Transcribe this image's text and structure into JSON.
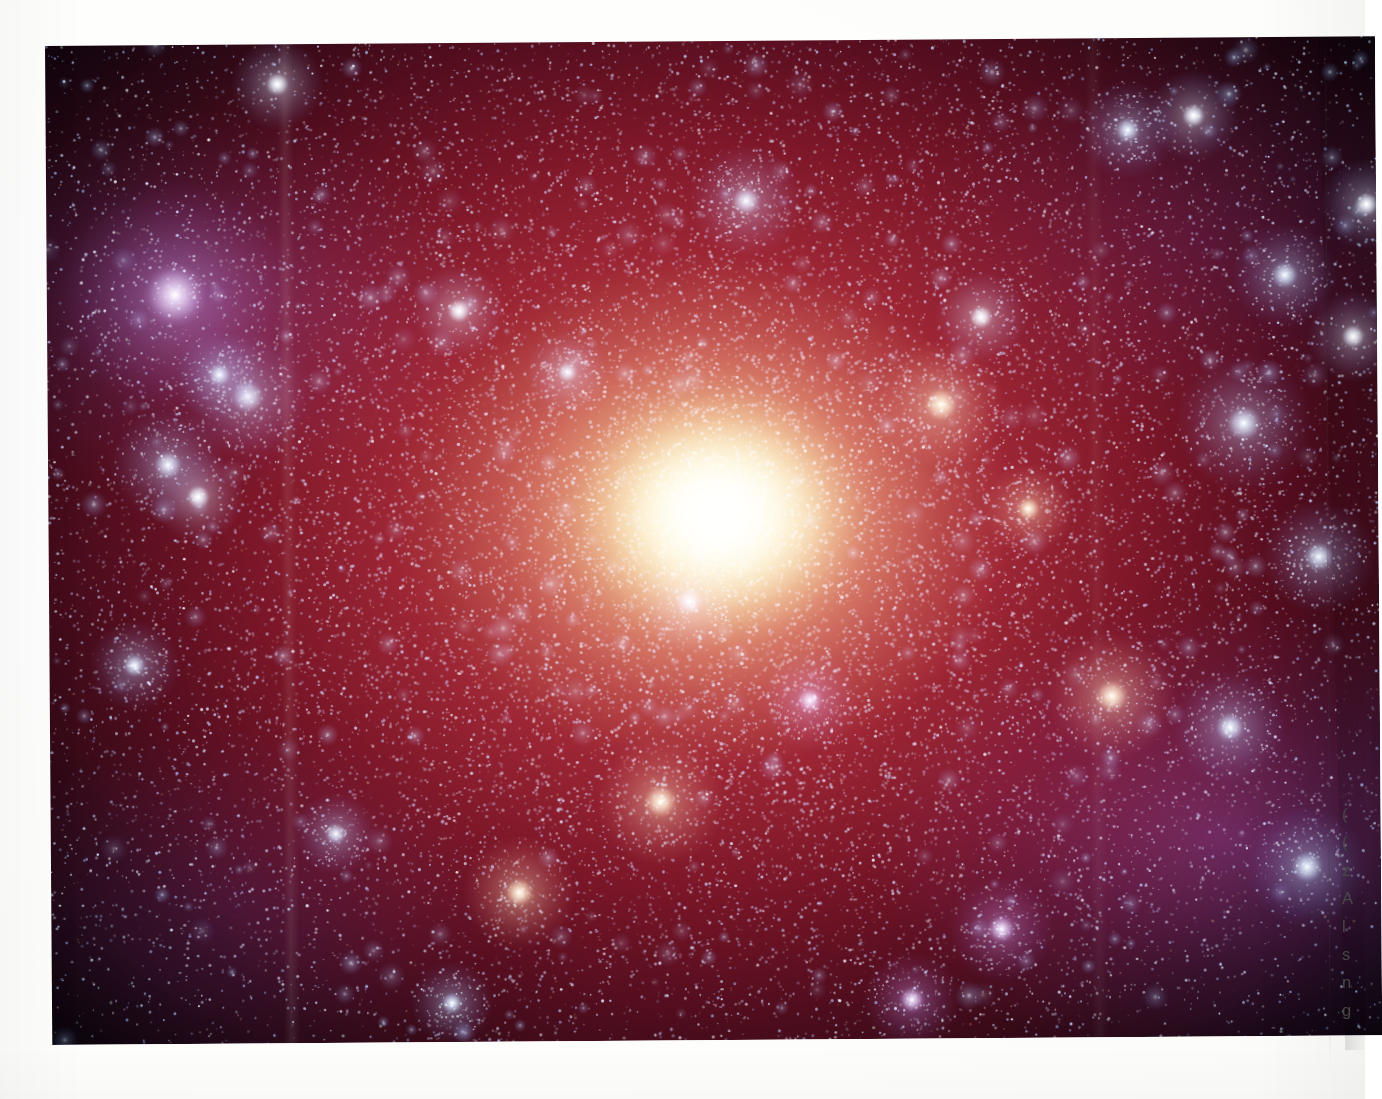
{
  "page": {
    "kind": "scanned-book-page",
    "background_color": "#fdfdfc",
    "orientation": "landscape"
  },
  "figure": {
    "name": "galaxy-photograph",
    "palette": {
      "nucleus": "#fffaf0",
      "inner_bulge": "#ffd89a",
      "mid_halo": "#b5243c",
      "outer_halo": "#4a0c1e",
      "sky": "#05040a",
      "stars": "#bcd8f5",
      "violet_fringe": "#8a48ac"
    },
    "frame": {
      "left": 45,
      "top": 46,
      "width": 1330,
      "height": 999,
      "rotation_deg": -0.42,
      "cropped_at_right_page_edge": true
    },
    "artifacts": [
      "vertical-scan-seam",
      "paper-vignette"
    ]
  },
  "text_column": {
    "name": "body-text-column",
    "note": "Body text column is cut off by the right-hand page edge; only the first glyph of each line is visible.",
    "divider_rule_color": "#3c3734",
    "text_color": "#4a4a48",
    "lines": [
      {
        "glyph": "(",
        "top": 806
      },
      {
        "glyph": "(",
        "top": 834
      },
      {
        "glyph": "z",
        "top": 862
      },
      {
        "glyph": "A",
        "top": 890
      },
      {
        "glyph": "l",
        "top": 918
      },
      {
        "glyph": "s",
        "top": 946
      },
      {
        "glyph": "n",
        "top": 974
      },
      {
        "glyph": "g",
        "top": 1002
      }
    ]
  }
}
